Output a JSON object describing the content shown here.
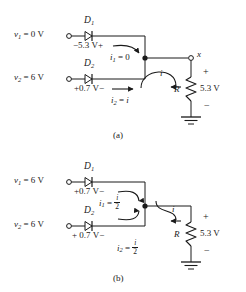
{
  "figure": {
    "background_color": "#ffffff",
    "line_color": "#1a1a1a"
  },
  "circuit_a": {
    "caption": "(a)",
    "source_1": {
      "label_v": "v",
      "label_sub": "1",
      "label_eq": " = 0 V",
      "full": "v1 = 0 V"
    },
    "source_2": {
      "label_v": "v",
      "label_sub": "2",
      "label_eq": " = 6 V",
      "full": "v2 = 6 V"
    },
    "diode_1": {
      "name": "D",
      "sub": "1",
      "drop_label": "−5.3 V",
      "polarity_left": "",
      "polarity_right": "+",
      "drop_full": "−5.3 V+"
    },
    "diode_2": {
      "name": "D",
      "sub": "2",
      "drop_label": "+0.7 V",
      "polarity_right": "−",
      "drop_full": "+0.7 V−"
    },
    "current_1": {
      "symbol": "i",
      "sub": "1",
      "value": " = 0"
    },
    "current_2": {
      "symbol": "i",
      "sub": "2",
      "value": " = ",
      "value_italic": "i"
    },
    "branch_current": "i",
    "node_label": "x",
    "resistor_label": "R",
    "output_voltage": "5.3 V",
    "polarity_plus": "+",
    "polarity_minus": "−"
  },
  "circuit_b": {
    "caption": "(b)",
    "source_1": {
      "label_v": "v",
      "label_sub": "1",
      "label_eq": " = 6 V",
      "full": "v1 = 6 V"
    },
    "source_2": {
      "label_v": "v",
      "label_sub": "2",
      "label_eq": " = 6 V",
      "full": "v2 = 6 V"
    },
    "diode_1": {
      "name": "D",
      "sub": "1",
      "drop_label": "+0.7 V",
      "polarity_right": "−",
      "drop_full": "+0.7 V−"
    },
    "diode_2": {
      "name": "D",
      "sub": "2",
      "drop_label": "+ 0.7 V",
      "polarity_right": "−",
      "drop_full": "+ 0.7 V−"
    },
    "current_1": {
      "symbol": "i",
      "sub": "1",
      "value": " = ",
      "fraction_num": "i",
      "fraction_den": "2"
    },
    "current_2": {
      "symbol": "i",
      "sub": "2",
      "value": " = ",
      "fraction_num": "i",
      "fraction_den": "2"
    },
    "branch_current": "i",
    "resistor_label": "R",
    "output_voltage": "5.3 V",
    "polarity_plus": "+",
    "polarity_minus": "−"
  }
}
